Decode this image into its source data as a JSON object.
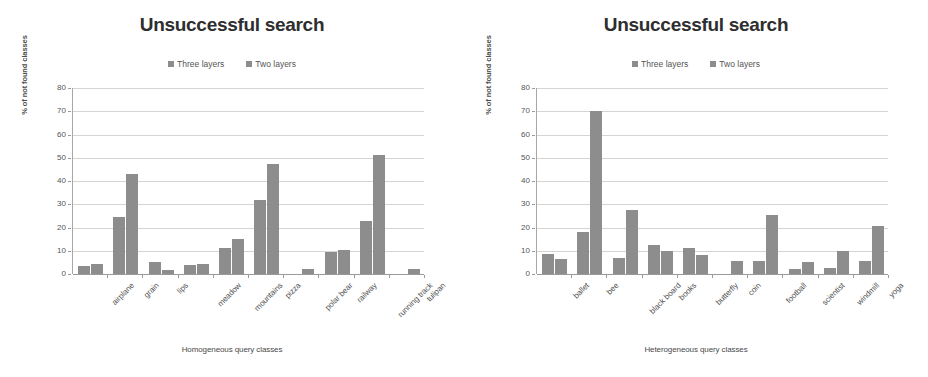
{
  "figure": {
    "panel_count": 2,
    "bar_colors": {
      "three_layers": "#8d8d8d",
      "two_layers": "#8d8d8d"
    },
    "grid_color": "#d4d4d4",
    "axis_color": "#9a9a9a"
  },
  "chart_data": [
    {
      "type": "bar",
      "title": "Unsuccessful search",
      "xlabel": "Homogeneous query classes",
      "ylabel": "% of not found classes",
      "ylim": [
        0,
        80
      ],
      "yticks": [
        0,
        10,
        20,
        30,
        40,
        50,
        60,
        70,
        80
      ],
      "grid": true,
      "legend_position": "top-center",
      "categories": [
        "airplane",
        "grain",
        "lips",
        "meadow",
        "mountains",
        "pizza",
        "polar bear",
        "railway",
        "running track",
        "tulipan"
      ],
      "series": [
        {
          "name": "Three layers",
          "values": [
            3.5,
            24.5,
            5,
            4,
            11,
            32,
            0,
            9.5,
            23,
            0
          ]
        },
        {
          "name": "Two layers",
          "values": [
            4.5,
            43,
            1.8,
            4.5,
            15,
            47.5,
            2,
            10.5,
            51,
            2
          ]
        }
      ]
    },
    {
      "type": "bar",
      "title": "Unsuccessful search",
      "xlabel": "Heterogeneous query classes",
      "ylabel": "% of not found classes",
      "ylim": [
        0,
        80
      ],
      "yticks": [
        0,
        10,
        20,
        30,
        40,
        50,
        60,
        70,
        80
      ],
      "grid": true,
      "legend_position": "top-center",
      "categories": [
        "ballet",
        "bee",
        "black board",
        "books",
        "butterfly",
        "coin",
        "football",
        "scientist",
        "windmill",
        "yoga"
      ],
      "series": [
        {
          "name": "Three layers",
          "values": [
            8.5,
            18,
            7,
            12.5,
            11,
            0,
            5.5,
            2,
            2.5,
            5.5
          ]
        },
        {
          "name": "Two layers",
          "values": [
            6.5,
            70,
            27.5,
            10,
            8,
            5.5,
            25.5,
            5,
            10,
            20.5
          ]
        }
      ]
    }
  ],
  "legend": {
    "items": [
      {
        "label": "Three layers",
        "color": "#8d8d8d"
      },
      {
        "label": "Two layers",
        "color": "#8d8d8d"
      }
    ]
  }
}
